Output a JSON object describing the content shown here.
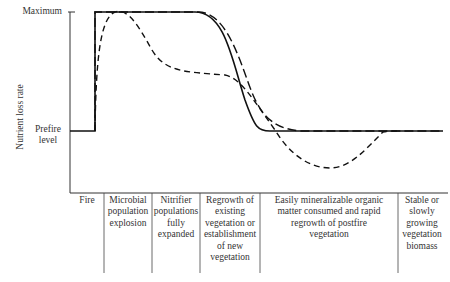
{
  "diagram": {
    "y_axis": {
      "label": "Nutrient loss rate",
      "ticks": {
        "maximum": "Maximum",
        "prefire": "Prefire level"
      }
    },
    "phases": [
      {
        "label": "Fire"
      },
      {
        "label": "Microbial population explosion"
      },
      {
        "label": "Nitrifier populations fully expanded"
      },
      {
        "label": "Regrowth of existing vegetation or establishment of new vegetation"
      },
      {
        "label": "Easily mineralizable organic matter consumed and rapid regrowth of postfire vegetation"
      },
      {
        "label": "Stable or slowly growing vegetation biomass"
      }
    ],
    "curves": [
      {
        "name": "solid",
        "style": "solid"
      },
      {
        "name": "long-dash",
        "style": "long dashed"
      },
      {
        "name": "short-dash",
        "style": "dashed"
      }
    ],
    "colors": {
      "line": "#1a1a1a",
      "text": "#333333",
      "background": "#ffffff"
    }
  }
}
